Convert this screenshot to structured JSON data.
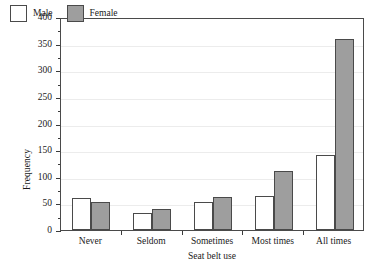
{
  "chart_data": {
    "type": "bar",
    "title": "",
    "subtitle": "",
    "xlabel": "Seat belt use",
    "ylabel": "Frequency",
    "categories": [
      "Never",
      "Seldom",
      "Sometimes",
      "Most times",
      "All times"
    ],
    "series": [
      {
        "name": "Male",
        "color": "#ffffff",
        "values": [
          60,
          32,
          52,
          63,
          140
        ]
      },
      {
        "name": "Female",
        "color": "#9e9e9e",
        "values": [
          53,
          39,
          62,
          110,
          358
        ]
      }
    ],
    "ylim": [
      0,
      400
    ],
    "ytick_step": 50,
    "yticks": [
      0,
      50,
      100,
      150,
      200,
      250,
      300,
      350,
      400
    ],
    "ytick_labels": [
      "0",
      "50",
      "100",
      "150",
      "200",
      "250",
      "300",
      "350",
      "400"
    ],
    "yminor_ticks": [
      25,
      75,
      125,
      175,
      225,
      275,
      325,
      375
    ],
    "grid": "horizontal-major",
    "grid_color": "#ececec",
    "legend_position": "top-left-inside",
    "legend": [
      "Male",
      "Female"
    ],
    "axis_color": "#4a4a4a",
    "bar_edge_color": "#4a4a4a",
    "background": "#ffffff"
  }
}
